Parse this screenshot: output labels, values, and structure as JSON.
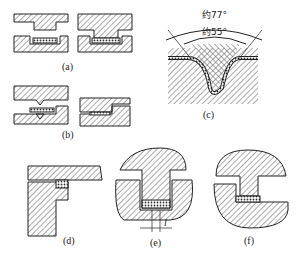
{
  "figure": {
    "panels": [
      {
        "id": "a",
        "label": "(a)",
        "description": "Two-part mold with flat insert, open and closed"
      },
      {
        "id": "b",
        "label": "(b)",
        "description": "Mold with single V-ridge, open and closed"
      },
      {
        "id": "c",
        "label": "(c)",
        "description": "V-groove cross-section with angle annotations",
        "annotations": {
          "outer_angle": "约77°",
          "inner_angle": "约55°"
        }
      },
      {
        "id": "d",
        "label": "(d)",
        "description": "T-shaped section with insert"
      },
      {
        "id": "e",
        "label": "(e)",
        "description": "T-plug in housing with dimension",
        "dimension_label": "l"
      },
      {
        "id": "f",
        "label": "(f)",
        "description": "Stepped plug in housing"
      }
    ]
  },
  "colors": {
    "line": "#222222",
    "hatch": "#555555",
    "background": "#ffffff"
  }
}
